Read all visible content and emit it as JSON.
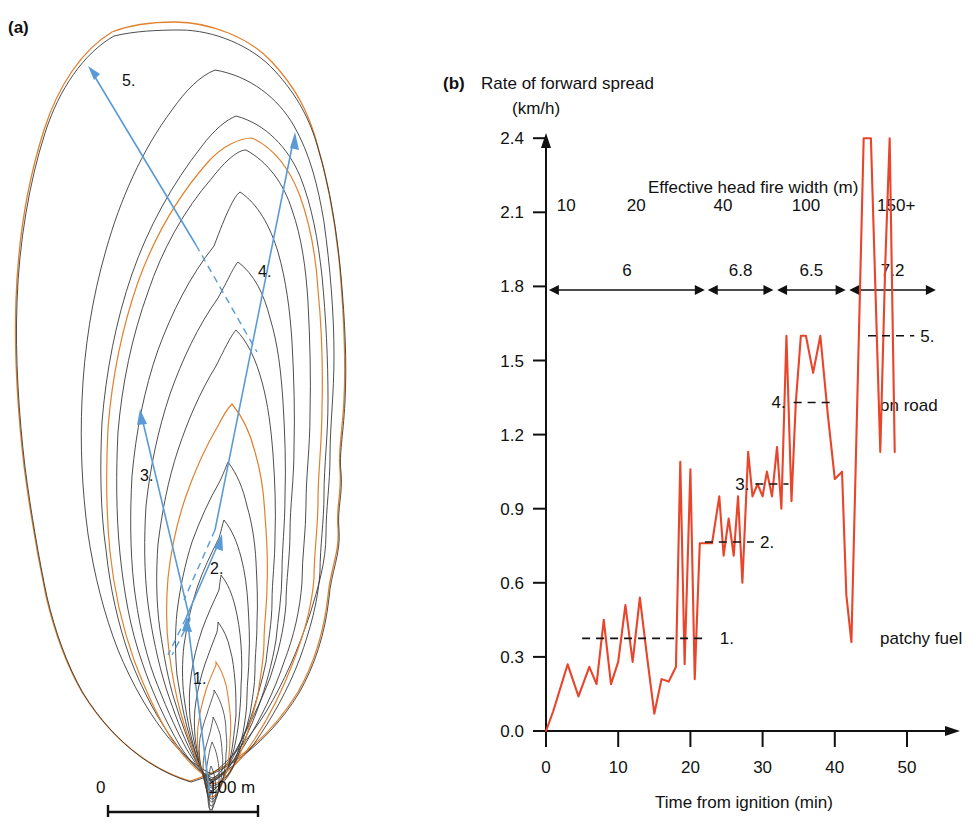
{
  "figure": {
    "panel_a_label": "(a)",
    "panel_b_label": "(b)"
  },
  "panel_a": {
    "name": "fire-perimeter-map",
    "scale_bar": {
      "start_label": "0",
      "end_label": "100 m",
      "length_m": 100
    },
    "arrow_markers": [
      {
        "id": "1.",
        "label": "1."
      },
      {
        "id": "2.",
        "label": "2."
      },
      {
        "id": "3.",
        "label": "3."
      },
      {
        "id": "4.",
        "label": "4."
      },
      {
        "id": "5.",
        "label": "5."
      }
    ],
    "colors": {
      "contour_black": "#333333",
      "contour_orange": "#E0812E",
      "arrow_blue": "#5B9BD5"
    }
  },
  "chart_data": {
    "type": "line",
    "title": "Rate of forward spread",
    "title_line2": "(km/h)",
    "xlabel": "Time from ignition (min)",
    "ylabel": "Rate of forward spread (km/h)",
    "secondary_axis_title": "Effective head fire width (m)",
    "xlim": [
      0,
      56
    ],
    "ylim": [
      0.0,
      2.55
    ],
    "xticks": [
      0,
      10,
      20,
      30,
      40,
      50
    ],
    "xtick_labels": [
      "0",
      "10",
      "20",
      "30",
      "40",
      "50"
    ],
    "yticks": [
      0.0,
      0.3,
      0.6,
      0.9,
      1.2,
      1.5,
      1.8,
      2.1,
      2.4
    ],
    "ytick_labels": [
      "0.0",
      "0.3",
      "0.6",
      "0.9",
      "1.2",
      "1.5",
      "1.8",
      "2.1",
      "2.4"
    ],
    "grid": false,
    "legend_position": "none",
    "line_color": "#E8452B",
    "series": [
      {
        "name": "Rate of forward spread",
        "x": [
          0.0,
          1.0,
          3.0,
          4.5,
          6.0,
          7.0,
          8.0,
          9.0,
          10.0,
          11.0,
          12.0,
          13.0,
          14.0,
          15.0,
          16.0,
          17.0,
          18.0,
          18.6,
          19.2,
          20.0,
          20.6,
          21.3,
          22.0,
          23.0,
          24.0,
          24.6,
          25.3,
          26.0,
          26.6,
          27.2,
          28.0,
          28.6,
          29.3,
          30.0,
          30.6,
          31.3,
          32.0,
          32.6,
          33.3,
          34.0,
          34.6,
          35.3,
          36.0,
          37.0,
          38.0,
          39.0,
          40.0,
          41.0,
          41.6,
          42.3,
          44.0,
          45.0,
          46.3,
          47.0,
          47.6,
          48.3
        ],
        "y": [
          0.0,
          0.08,
          0.27,
          0.14,
          0.26,
          0.19,
          0.45,
          0.19,
          0.28,
          0.51,
          0.28,
          0.54,
          0.3,
          0.07,
          0.21,
          0.2,
          0.26,
          1.09,
          0.27,
          1.06,
          0.21,
          0.76,
          0.76,
          0.76,
          0.95,
          0.71,
          0.86,
          0.71,
          0.95,
          0.6,
          1.13,
          0.95,
          1.0,
          0.95,
          1.05,
          0.95,
          1.15,
          0.9,
          1.6,
          0.93,
          1.33,
          1.6,
          1.6,
          1.45,
          1.6,
          1.29,
          1.02,
          1.05,
          0.55,
          0.36,
          2.4,
          2.4,
          1.13,
          1.9,
          2.4,
          1.13
        ]
      }
    ],
    "reference_lines": [
      {
        "label": "1.",
        "y": 0.375,
        "x_start": 5.0,
        "x_end": 22.0
      },
      {
        "label": "2.",
        "y": 0.765,
        "x_start": 22.0,
        "x_end": 28.8
      },
      {
        "label": "3.",
        "y": 1.0,
        "x_start": 29.0,
        "x_end": 33.6
      },
      {
        "label": "4.",
        "y": 1.33,
        "x_start": 34.3,
        "x_end": 40.0
      },
      {
        "label": "5.",
        "y": 1.6,
        "x_start": 44.6,
        "x_end": 51.0
      }
    ],
    "head_fire_width": {
      "axis_title": "Effective head fire width (m)",
      "categories": [
        "10",
        "20",
        "40",
        "100",
        "150+"
      ],
      "category_x": [
        2.8,
        12.5,
        24.5,
        36.0,
        48.5
      ],
      "segments": [
        {
          "value": "6",
          "x_start": 0.4,
          "x_end": 22.0
        },
        {
          "value": "6.8",
          "x_start": 22.4,
          "x_end": 31.5
        },
        {
          "value": "6.5",
          "x_start": 32.0,
          "x_end": 41.5
        },
        {
          "value": "7.2",
          "x_start": 42.0,
          "x_end": 54.0
        }
      ]
    },
    "annotations": [
      {
        "text": "on road",
        "x": 49.5,
        "y": 1.13
      },
      {
        "text": "patchy fuel",
        "x": 49.5,
        "y": 0.37
      }
    ]
  }
}
